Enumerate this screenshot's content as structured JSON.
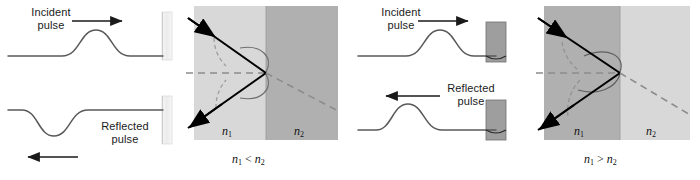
{
  "figure": {
    "type": "physics-diagram",
    "width": 700,
    "height": 180
  },
  "colors": {
    "background": "#ffffff",
    "ink": "#1a1a1a",
    "string": "#595959",
    "ray": "#000000",
    "dashed": "#8c8c8c",
    "wavefront": "#6e6e6e",
    "medium_light": "#d8d8d8",
    "medium_dark": "#b0b0b0",
    "wall_fixed": "#e8e8e8",
    "wall_free": "#9e9e9e"
  },
  "panels": [
    {
      "id": "denser-medium",
      "string_diagram": {
        "incident_label": "Incident\npulse",
        "reflected_label": "Reflected\npulse",
        "incident_arrow_direction": "right",
        "reflected_arrow_direction": "left",
        "incident_pulse_orientation": "crest",
        "reflected_pulse_orientation": "trough",
        "boundary_type": "fixed-end",
        "phase_change": "inverted"
      },
      "refraction_diagram": {
        "medium1_label": "n1",
        "medium2_label": "n2",
        "medium1_shade": "light",
        "medium2_shade": "dark",
        "incoming_ray": "from upper-left",
        "reflected_ray": "to lower-left",
        "refracted_ray": "dashed, to lower-right",
        "normal": "dashed horizontal"
      },
      "relation": {
        "left": "n",
        "left_sub": "1",
        "operator": "<",
        "right": "n",
        "right_sub": "2",
        "text": "n1 < n2"
      }
    },
    {
      "id": "rarer-medium",
      "string_diagram": {
        "incident_label": "Incident\npulse",
        "reflected_label": "Reflected\npulse",
        "incident_arrow_direction": "right",
        "reflected_arrow_direction": "left",
        "incident_pulse_orientation": "crest",
        "reflected_pulse_orientation": "crest",
        "boundary_type": "free-end",
        "phase_change": "none"
      },
      "refraction_diagram": {
        "medium1_label": "n1",
        "medium2_label": "n2",
        "medium1_shade": "dark",
        "medium2_shade": "light",
        "incoming_ray": "from upper-left",
        "reflected_ray": "to lower-left",
        "refracted_ray": "dashed, to lower-right",
        "normal": "dashed horizontal"
      },
      "relation": {
        "left": "n",
        "left_sub": "1",
        "operator": ">",
        "right": "n",
        "right_sub": "2",
        "text": "n1 > n2"
      }
    }
  ]
}
